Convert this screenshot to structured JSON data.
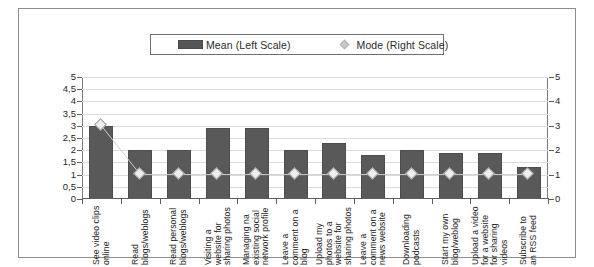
{
  "chart_data": {
    "type": "bar",
    "title": "",
    "subtitle": "",
    "xlabel": "",
    "ylabel": "",
    "categories": [
      "See video clips online",
      "Read blogs/weblogs",
      "Read personal blogs/weblogs",
      "Visiting a website for sharing photos",
      "Managing na existing social network profile",
      "Leave a comment on a blog",
      "Upload my photos to a website for sharing photos",
      "Leave a comment on a news website",
      "Downloading podcasts",
      "Start my own blog/weblog",
      "Upload a video for a website for sharing videos",
      "Subscribe to an RSS feed"
    ],
    "series": [
      {
        "name": "Mean (Left Scale)",
        "axis": "left",
        "render": "bar",
        "color": "#595959",
        "values": [
          3.0,
          2.0,
          2.0,
          2.9,
          2.9,
          2.0,
          2.3,
          1.8,
          2.0,
          1.9,
          1.9,
          1.3
        ]
      },
      {
        "name": "Mode (Right Scale)",
        "axis": "right",
        "render": "line-marker",
        "color": "#eeeeee",
        "values": [
          3,
          1,
          1,
          1,
          1,
          1,
          1,
          1,
          1,
          1,
          1,
          1
        ]
      }
    ],
    "y_left": {
      "min": 0,
      "max": 5,
      "step": 0.5,
      "ticks": [
        "0",
        "0,5",
        "1",
        "1,5",
        "2",
        "2,5",
        "3",
        "3,5",
        "4",
        "4,5",
        "5"
      ]
    },
    "y_right": {
      "min": 0,
      "max": 5,
      "step": 1,
      "ticks": [
        "0",
        "1",
        "2",
        "3",
        "4",
        "5"
      ]
    },
    "grid": true,
    "legend_position": "top-center"
  },
  "legend": {
    "mean_label": "Mean (Left Scale)",
    "mode_label": "Mode (Right Scale)"
  }
}
